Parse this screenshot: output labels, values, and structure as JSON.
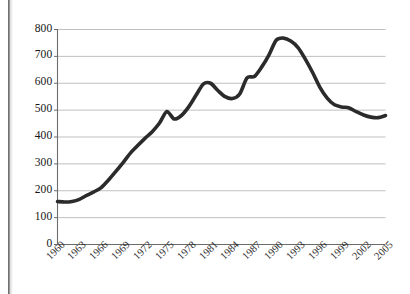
{
  "chart_data": {
    "type": "line",
    "title": "",
    "subtitle": "",
    "xlabel": "",
    "ylabel": "",
    "legend": [],
    "legend_position": "none",
    "grid": "horizontal",
    "xlim": [
      1960,
      2005
    ],
    "ylim": [
      0,
      800
    ],
    "y_ticks": [
      0,
      100,
      200,
      300,
      400,
      500,
      600,
      700,
      800
    ],
    "y_tick_labels": [
      "0",
      "100",
      "200",
      "300",
      "400",
      "500",
      "600",
      "700",
      "800"
    ],
    "x_ticks": [
      1960,
      1963,
      1966,
      1969,
      1972,
      1975,
      1978,
      1981,
      1984,
      1987,
      1990,
      1993,
      1996,
      1999,
      2002,
      2005
    ],
    "x_tick_labels": [
      "1960",
      "1963",
      "1966",
      "1969",
      "1972",
      "1975",
      "1978",
      "1981",
      "1984",
      "1987",
      "1990",
      "1993",
      "1996",
      "1999",
      "2002",
      "2005"
    ],
    "x_tick_rotation": -45,
    "line_color": "#2b2b2b",
    "line_width": 3.6,
    "grid_color": "#b9b9b9",
    "axis_color": "#6b6b6b",
    "x": [
      1960,
      1961,
      1962,
      1963,
      1964,
      1965,
      1966,
      1967,
      1968,
      1969,
      1970,
      1971,
      1972,
      1973,
      1974,
      1975,
      1976,
      1977,
      1978,
      1979,
      1980,
      1981,
      1982,
      1983,
      1984,
      1985,
      1986,
      1987,
      1988,
      1989,
      1990,
      1991,
      1992,
      1993,
      1994,
      1995,
      1996,
      1997,
      1998,
      1999,
      2000,
      2001,
      2002,
      2003,
      2004,
      2005
    ],
    "values": [
      160,
      158,
      160,
      168,
      183,
      196,
      212,
      240,
      272,
      305,
      340,
      368,
      395,
      420,
      452,
      495,
      467,
      480,
      512,
      555,
      597,
      600,
      573,
      550,
      543,
      560,
      620,
      625,
      660,
      705,
      760,
      768,
      757,
      733,
      690,
      640,
      585,
      545,
      520,
      512,
      508,
      494,
      482,
      474,
      472,
      480
    ],
    "series": [
      {
        "name": "series-1",
        "values": [
          160,
          158,
          160,
          168,
          183,
          196,
          212,
          240,
          272,
          305,
          340,
          368,
          395,
          420,
          452,
          495,
          467,
          480,
          512,
          555,
          597,
          600,
          573,
          550,
          543,
          560,
          620,
          625,
          660,
          705,
          760,
          768,
          757,
          733,
          690,
          640,
          585,
          545,
          520,
          512,
          508,
          494,
          482,
          474,
          472,
          480
        ]
      }
    ],
    "annotations": []
  }
}
